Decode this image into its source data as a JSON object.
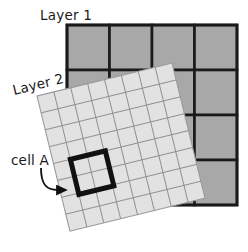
{
  "figure": {
    "type": "diagram",
    "background_color": "#ffffff"
  },
  "labels": {
    "layer1": "Layer 1",
    "layer2": "Layer 2",
    "cell_a": "cell A"
  },
  "layer1": {
    "name": "Layer 1",
    "rows": 4,
    "cols": 4,
    "fill_color": "#a8a8a8",
    "stroke_color": "#1a1a1a",
    "stroke_width": 2.6,
    "x": 67,
    "y": 25,
    "width": 170,
    "height": 180,
    "rotation_deg": 0
  },
  "layer2": {
    "name": "Layer 2",
    "rows": 8,
    "cols": 8,
    "fill_color": "#e2e2e2",
    "stroke_color": "#8d8d8d",
    "stroke_width": 0.9,
    "outline_color": "#9a9a9a",
    "size": 139,
    "origin_x": 37,
    "origin_y": 96,
    "rotation_deg": -13.7
  },
  "cell_a": {
    "label": "cell A",
    "stroke_color": "#111111",
    "stroke_width": 5,
    "grid_col": 1,
    "grid_row": 4,
    "span_cols": 2,
    "span_rows": 2
  },
  "annotation": {
    "text": "cell A",
    "text_x": 12,
    "text_y": 162,
    "arrow_color": "#111111",
    "arrow_head": "triangle"
  },
  "layer1_label_position": {
    "x": 40,
    "y": 18,
    "rotation_deg": 0
  },
  "layer2_label_position": {
    "x": 14,
    "y": 93,
    "rotation_deg": -13.7
  }
}
